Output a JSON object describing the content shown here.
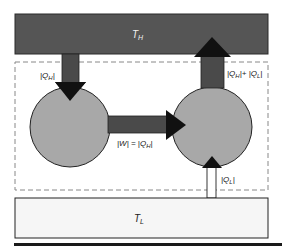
{
  "diagram": {
    "type": "heat-pump-cycle",
    "hot_reservoir": {
      "label": "T",
      "subscript": "H",
      "fill": "#555555"
    },
    "cold_reservoir": {
      "label": "T",
      "subscript": "L",
      "fill": "#f6f6f6"
    },
    "boundary": {
      "style": "dashed",
      "color": "#888888"
    },
    "left_device": {
      "shape": "circle",
      "fill": "#a8a8a8"
    },
    "right_device": {
      "shape": "circle",
      "fill": "#a8a8a8"
    },
    "flows": [
      {
        "id": "qh_in",
        "from": "hot_reservoir",
        "to": "left_device",
        "label": "|Q_H|",
        "text_main": "|Q",
        "text_sub": "H",
        "text_end": "|"
      },
      {
        "id": "work",
        "from": "left_device",
        "to": "right_device",
        "label": "|W| = |Q_H|",
        "text_main": "|W| = |Q",
        "text_sub": "H",
        "text_end": "|"
      },
      {
        "id": "q_out",
        "from": "right_device",
        "to": "hot_reservoir",
        "label": "|Q_H| + |Q_L|",
        "text_a": "|Q",
        "sub_a": "H",
        "text_b": "|+ |Q",
        "sub_b": "L",
        "text_end": "|"
      },
      {
        "id": "ql_in",
        "from": "cold_reservoir",
        "to": "right_device",
        "label": "|Q_L|",
        "text_main": "|Q",
        "text_sub": "L",
        "text_end": "|"
      }
    ],
    "colors": {
      "arrow_shaft": "#4a4a4a",
      "arrow_head": "#111111",
      "outline": "#222222"
    }
  }
}
